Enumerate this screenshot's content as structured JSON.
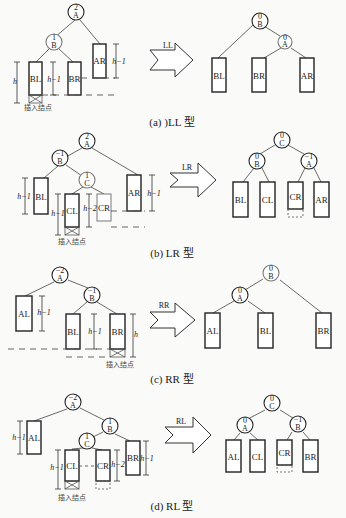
{
  "figure": "AVL tree rotation types",
  "panels": [
    {
      "id": "LL",
      "caption": "(a) )LL 型",
      "arrow_label": "LL",
      "insert_label": "插入结点",
      "before": {
        "nodes": [
          {
            "name": "A",
            "bf": "2"
          },
          {
            "name": "B",
            "bf": "1"
          }
        ],
        "subtrees": [
          {
            "name": "BL",
            "height": "h"
          },
          {
            "name": "BR",
            "height": "h−1"
          },
          {
            "name": "AR",
            "height": "h−1"
          }
        ]
      },
      "after": {
        "nodes": [
          {
            "name": "B",
            "bf": "0"
          },
          {
            "name": "A",
            "bf": "0"
          }
        ],
        "subtrees": [
          "BL",
          "BR",
          "AR"
        ]
      }
    },
    {
      "id": "LR",
      "caption": "(b) LR 型",
      "arrow_label": "LR",
      "insert_label": "插入结点",
      "before": {
        "nodes": [
          {
            "name": "A",
            "bf": "2"
          },
          {
            "name": "B",
            "bf": "−1"
          },
          {
            "name": "C",
            "bf": "1"
          }
        ],
        "subtrees": [
          {
            "name": "BL",
            "height": "h−1"
          },
          {
            "name": "CL",
            "height": "h−1"
          },
          {
            "name": "CR",
            "height": "h−2"
          },
          {
            "name": "AR",
            "height": "h−1"
          }
        ]
      },
      "after": {
        "nodes": [
          {
            "name": "C",
            "bf": "0"
          },
          {
            "name": "B",
            "bf": "0"
          },
          {
            "name": "A",
            "bf": "−1"
          }
        ],
        "subtrees": [
          "BL",
          "CL",
          "CR",
          "AR"
        ]
      }
    },
    {
      "id": "RR",
      "caption": "(c) RR 型",
      "arrow_label": "RR",
      "insert_label": "插入结点",
      "before": {
        "nodes": [
          {
            "name": "A",
            "bf": "−2"
          },
          {
            "name": "B",
            "bf": "−1"
          }
        ],
        "subtrees": [
          {
            "name": "AL",
            "height": "h−1"
          },
          {
            "name": "BL",
            "height": "h−1"
          },
          {
            "name": "BR",
            "height": "h"
          }
        ]
      },
      "after": {
        "nodes": [
          {
            "name": "B",
            "bf": "0"
          },
          {
            "name": "A",
            "bf": "0"
          }
        ],
        "subtrees": [
          "AL",
          "BL",
          "BR"
        ]
      }
    },
    {
      "id": "RL",
      "caption": "(d) RL 型",
      "arrow_label": "RL",
      "insert_label": "插入结点",
      "before": {
        "nodes": [
          {
            "name": "A",
            "bf": "−2"
          },
          {
            "name": "B",
            "bf": "1"
          },
          {
            "name": "C",
            "bf": "1"
          }
        ],
        "subtrees": [
          {
            "name": "AL",
            "height": "h−1"
          },
          {
            "name": "CL",
            "height": "h−1"
          },
          {
            "name": "CR",
            "height": "h−2"
          },
          {
            "name": "BR",
            "height": "h−1"
          }
        ]
      },
      "after": {
        "nodes": [
          {
            "name": "C",
            "bf": "0"
          },
          {
            "name": "A",
            "bf": "0"
          },
          {
            "name": "B",
            "bf": "−1"
          }
        ],
        "subtrees": [
          "AL",
          "CL",
          "CR",
          "BR"
        ]
      }
    }
  ]
}
